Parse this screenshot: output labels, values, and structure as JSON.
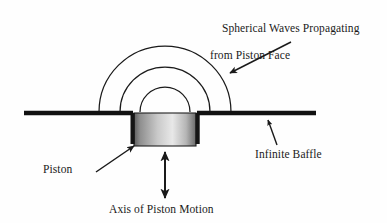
{
  "figure": {
    "labels": {
      "waves_line1": "Spherical Waves Propagating",
      "waves_line2": "from Piston Face",
      "piston": "Piston",
      "baffle": "Infinite Baffle",
      "axis": "Axis of Piston Motion"
    },
    "icons": {
      "waves_arrow": "arrow-down-left-icon",
      "piston_arrow": "arrow-up-right-icon",
      "baffle_arrow": "arrow-up-right-icon",
      "axis_arrow": "double-arrow-vertical-icon"
    },
    "colors": {
      "stroke": "#1a1a1a",
      "baffle": "#111111",
      "piston_light": "#e8e8e8",
      "piston_dark": "#5e5e5e",
      "background": "#fefefe",
      "text": "#1a1a1a"
    },
    "geometry": {
      "baffle_y": 113,
      "baffle_x_start": 24,
      "baffle_x_end": 316,
      "piston_center_x": 165,
      "piston_width": 62,
      "piston_height": 32,
      "wave_radii": [
        25,
        45,
        66
      ],
      "wave_count": 3
    }
  }
}
